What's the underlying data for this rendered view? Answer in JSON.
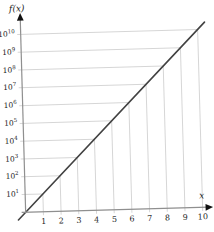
{
  "figure": {
    "y_axis_title": "f(x)",
    "x_axis_title": "x"
  },
  "chart_data": {
    "type": "line",
    "title": "",
    "xlabel": "x",
    "ylabel": "f(x)",
    "y_scale": "log10",
    "x": [
      0,
      1,
      2,
      3,
      4,
      5,
      6,
      7,
      8,
      9,
      10
    ],
    "y": [
      1,
      10,
      100,
      1000,
      10000,
      100000,
      1000000,
      10000000,
      100000000,
      1000000000,
      10000000000
    ],
    "x_tick_labels": [
      "1",
      "2",
      "3",
      "4",
      "5",
      "6",
      "7",
      "8",
      "9",
      "10"
    ],
    "y_tick_base": "10",
    "y_tick_exponents": [
      1,
      2,
      3,
      4,
      5,
      6,
      7,
      8,
      9,
      10
    ],
    "xlim": [
      0,
      10.6
    ],
    "ylim_log10": [
      0,
      10.9
    ],
    "grid": "on",
    "grid_clipped_at_line": true,
    "legend": "none",
    "colors": {
      "line": "#424242",
      "grid": "#d6d6d6",
      "axis": "#8f8f8f",
      "arrowhead": "#111111",
      "text": "#232323"
    }
  }
}
